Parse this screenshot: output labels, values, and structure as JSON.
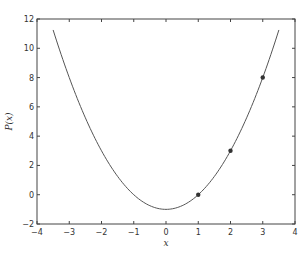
{
  "chart_data": {
    "type": "line",
    "title": "",
    "xlabel": "x",
    "ylabel": "P(x)",
    "xlim": [
      -4,
      4
    ],
    "ylim": [
      -2,
      12
    ],
    "xticks": [
      -4,
      -3,
      -2,
      -1,
      0,
      1,
      2,
      3,
      4
    ],
    "yticks": [
      -2,
      0,
      2,
      4,
      6,
      8,
      10,
      12
    ],
    "grid": false,
    "series": [
      {
        "name": "P(x)",
        "kind": "line",
        "function": "x^2 - 1",
        "x_range": [
          -3.5,
          3.5
        ],
        "color": "#555555"
      },
      {
        "name": "data points",
        "kind": "scatter",
        "x": [
          1,
          2,
          3
        ],
        "y": [
          0,
          3,
          8
        ],
        "color": "#333333"
      }
    ]
  }
}
